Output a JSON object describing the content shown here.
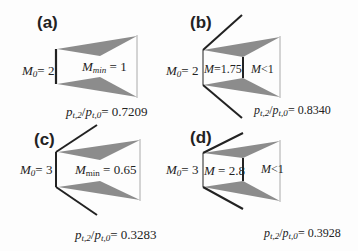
{
  "panels": [
    {
      "id": "a",
      "label": "(a)",
      "m0_sym": "M",
      "m0_sub": "0",
      "m0_val": "= 2",
      "inner_sym": "M",
      "inner_sub": "min",
      "inner_val": "= 1",
      "ratio_num": "p",
      "ratio_num_sub": "t,2",
      "ratio_den": "p",
      "ratio_den_sub": "t,0",
      "ratio_val": "= 0.7209"
    },
    {
      "id": "b",
      "label": "(b)",
      "m0_sym": "M",
      "m0_sub": "0",
      "m0_val": "= 2",
      "inner_sym": "M",
      "inner_val": "=1.75",
      "outer_sym": "M",
      "outer_val": "<1",
      "ratio_num": "p",
      "ratio_num_sub": "t,2",
      "ratio_den": "p",
      "ratio_den_sub": "t,0",
      "ratio_val": "= 0.8340"
    },
    {
      "id": "c",
      "label": "(c)",
      "m0_sym": "M",
      "m0_sub": "0",
      "m0_val": "= 3",
      "inner_sym": "M",
      "inner_sub": "min",
      "inner_val": "= 0.65",
      "ratio_num": "p",
      "ratio_num_sub": "t,2",
      "ratio_den": "p",
      "ratio_den_sub": "t,0",
      "ratio_val": "= 0.3283"
    },
    {
      "id": "d",
      "label": "(d)",
      "m0_sym": "M",
      "m0_sub": "0",
      "m0_val": "= 3",
      "inner_sym": "M",
      "inner_val": "= 2.8",
      "outer_sym": "M",
      "outer_val": "<1",
      "ratio_num": "p",
      "ratio_num_sub": "t,2",
      "ratio_den": "p",
      "ratio_den_sub": "t,0",
      "ratio_val": "= 0.3928"
    }
  ],
  "colors": {
    "fill": "#8c8c8c",
    "line": "#222222",
    "thin": "#aaaaaa"
  }
}
